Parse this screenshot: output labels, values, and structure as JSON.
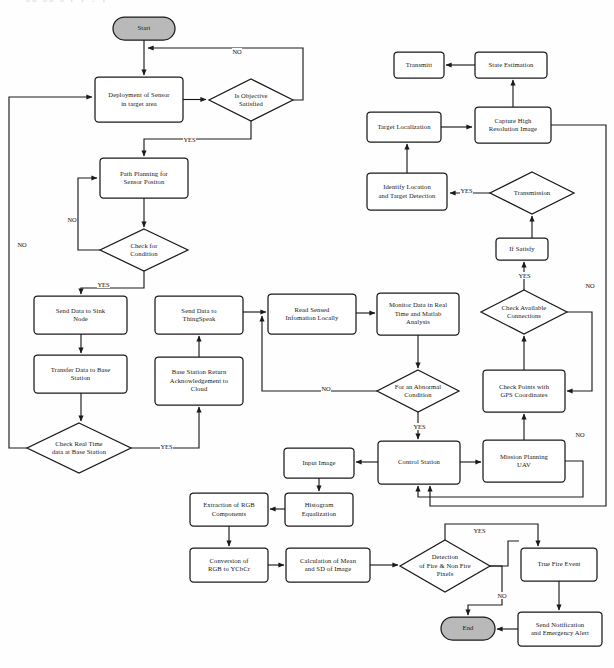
{
  "figure": {
    "domain": "flowchart-diagram",
    "cut_off_caption_remnant": "gg gg g p p y p",
    "colors": {
      "stroke": "#1a1a1a",
      "terminal_fill": "#b9b9b9",
      "process_fill": "#ffffff",
      "background": "#fefefe"
    }
  },
  "nodes": {
    "start": {
      "label": "Start",
      "shape": "terminal",
      "x": 113,
      "y": 17,
      "w": 62,
      "h": 23
    },
    "deployment": {
      "label": "Deployment of Sensor\nin target area",
      "shape": "process",
      "x": 95,
      "y": 77,
      "w": 88,
      "h": 45
    },
    "is_objective": {
      "label": "Is Objective\nSatisfied",
      "shape": "decision",
      "x": 209,
      "y": 79,
      "w": 84,
      "h": 42
    },
    "path_planning": {
      "label": "Path Planning for\nSensor Positon",
      "shape": "process",
      "x": 100,
      "y": 158,
      "w": 88,
      "h": 40
    },
    "check_condition": {
      "label": "Check  for\nCondition",
      "shape": "decision",
      "x": 100,
      "y": 229,
      "w": 88,
      "h": 42
    },
    "send_sink": {
      "label": "Send Data to Sink\nNode",
      "shape": "process",
      "x": 34,
      "y": 296,
      "w": 93,
      "h": 38
    },
    "transfer_base": {
      "label": "Transfer Data to Base\nStation",
      "shape": "process",
      "x": 34,
      "y": 355,
      "w": 93,
      "h": 38
    },
    "check_realtime": {
      "label": "Check Real Time\ndata at Base Station",
      "shape": "decision",
      "x": 27,
      "y": 423,
      "w": 104,
      "h": 50
    },
    "send_thingspeak": {
      "label": "Send Data to\nThingSpeak",
      "shape": "process",
      "x": 155,
      "y": 296,
      "w": 88,
      "h": 38
    },
    "base_ack": {
      "label": "Base Station Return\nAcknowledgement to\nCloud",
      "shape": "process",
      "x": 155,
      "y": 357,
      "w": 88,
      "h": 48
    },
    "read_sensed": {
      "label": "Read Sensed\nInfomation Locally",
      "shape": "process",
      "x": 268,
      "y": 294,
      "w": 88,
      "h": 40
    },
    "monitor_data": {
      "label": "Monitor Data in Real\nTime and Matlab\nAnalysis",
      "shape": "process",
      "x": 377,
      "y": 293,
      "w": 82,
      "h": 42
    },
    "abnormal": {
      "label": "For an Abnormal\nCondition",
      "shape": "decision",
      "x": 377,
      "y": 370,
      "w": 82,
      "h": 42
    },
    "input_image": {
      "label": "Input Image",
      "shape": "process",
      "x": 284,
      "y": 448,
      "w": 70,
      "h": 30
    },
    "control_station": {
      "label": "Control Station",
      "shape": "process",
      "x": 378,
      "y": 441,
      "w": 82,
      "h": 43
    },
    "histogram": {
      "label": "Histogram\nEqualization",
      "shape": "process",
      "x": 285,
      "y": 493,
      "w": 68,
      "h": 33
    },
    "extraction_rgb": {
      "label": "Extraction of RGB\nComponents",
      "shape": "process",
      "x": 190,
      "y": 493,
      "w": 78,
      "h": 33
    },
    "conversion_rgb": {
      "label": "Conversion of\nRGB to YCbCr",
      "shape": "process",
      "x": 190,
      "y": 548,
      "w": 78,
      "h": 34
    },
    "calc_mean": {
      "label": "Calculation of Mean\nand SD of Image",
      "shape": "process",
      "x": 286,
      "y": 548,
      "w": 84,
      "h": 34
    },
    "detection_fire": {
      "label": "Detection\nof Fire & Non Fire\nPixels",
      "shape": "decision",
      "x": 400,
      "y": 540,
      "w": 90,
      "h": 52
    },
    "true_fire": {
      "label": "True Fire Event",
      "shape": "process",
      "x": 521,
      "y": 548,
      "w": 76,
      "h": 33
    },
    "send_notification": {
      "label": "Send Notification\nand Emergency Alert",
      "shape": "process",
      "x": 518,
      "y": 612,
      "w": 84,
      "h": 34
    },
    "end": {
      "label": "End",
      "shape": "terminal",
      "x": 441,
      "y": 617,
      "w": 54,
      "h": 23
    },
    "transmitt": {
      "label": "Transmitt",
      "shape": "process",
      "x": 394,
      "y": 52,
      "w": 50,
      "h": 26
    },
    "state_estimation": {
      "label": "State Estimation",
      "shape": "process",
      "x": 475,
      "y": 52,
      "w": 72,
      "h": 26
    },
    "target_localization": {
      "label": "Target Localization",
      "shape": "process",
      "x": 367,
      "y": 112,
      "w": 74,
      "h": 30
    },
    "capture_image": {
      "label": "Capture High\nResolution Image",
      "shape": "process",
      "x": 475,
      "y": 107,
      "w": 76,
      "h": 36
    },
    "identify_location": {
      "label": "Identify Location\nand Target Detection",
      "shape": "process",
      "x": 367,
      "y": 173,
      "w": 80,
      "h": 37
    },
    "transmission": {
      "label": "Transmission",
      "shape": "decision",
      "x": 490,
      "y": 172,
      "w": 84,
      "h": 42
    },
    "if_satisfy": {
      "label": "If Satisfy",
      "shape": "process",
      "x": 496,
      "y": 238,
      "w": 52,
      "h": 22
    },
    "check_available": {
      "label": "Check Available\nConnections",
      "shape": "decision",
      "x": 481,
      "y": 290,
      "w": 86,
      "h": 44
    },
    "check_points_gps": {
      "label": "Check Points with\nGPS Coordinates",
      "shape": "process",
      "x": 483,
      "y": 370,
      "w": 82,
      "h": 42
    },
    "mission_planning": {
      "label": "Mission Planning\nUAV",
      "shape": "process",
      "x": 483,
      "y": 440,
      "w": 82,
      "h": 42
    }
  },
  "edge_labels": [
    {
      "id": "no-objective-top",
      "text": "NO",
      "x": 232,
      "y": 48
    },
    {
      "id": "yes-objective",
      "text": "YES",
      "x": 183,
      "y": 136
    },
    {
      "id": "no-check-condition",
      "text": "NO",
      "x": 67,
      "y": 216
    },
    {
      "id": "no-left-outer",
      "text": "NO",
      "x": 17,
      "y": 241
    },
    {
      "id": "yes-check-condition",
      "text": "YES",
      "x": 97,
      "y": 281
    },
    {
      "id": "yes-realtime",
      "text": "YES",
      "x": 160,
      "y": 443
    },
    {
      "id": "no-abnormal",
      "text": "NO",
      "x": 321,
      "y": 385
    },
    {
      "id": "yes-abnormal",
      "text": "YES",
      "x": 413,
      "y": 423
    },
    {
      "id": "yes-transmission",
      "text": "YES",
      "x": 460,
      "y": 187
    },
    {
      "id": "yes-ifsatisfy",
      "text": "YES",
      "x": 518,
      "y": 272
    },
    {
      "id": "no-right-outer",
      "text": "NO",
      "x": 585,
      "y": 282
    },
    {
      "id": "no-right-inner",
      "text": "NO",
      "x": 575,
      "y": 431
    },
    {
      "id": "yes-detection-fire",
      "text": "YES",
      "x": 473,
      "y": 527
    },
    {
      "id": "no-detection-fire",
      "text": "NO",
      "x": 497,
      "y": 592
    }
  ]
}
